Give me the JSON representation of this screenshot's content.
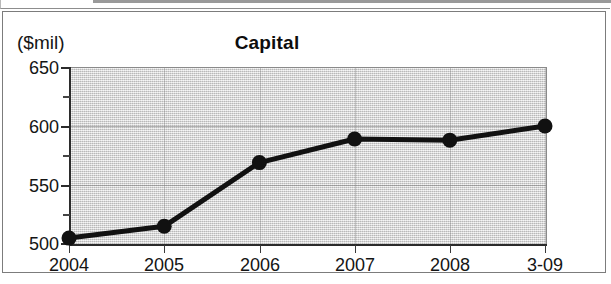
{
  "chart_data": {
    "type": "line",
    "title": "Capital",
    "xlabel": "",
    "ylabel": "($mil)",
    "categories": [
      "2004",
      "2005",
      "2006",
      "2007",
      "2008",
      "3-09"
    ],
    "values": [
      505,
      515,
      569,
      589,
      588,
      600
    ],
    "series": [
      {
        "name": "Capital",
        "values": [
          505,
          515,
          569,
          589,
          588,
          600
        ]
      }
    ],
    "ylim": [
      500,
      650
    ],
    "ytick_labels": [
      "500",
      "550",
      "600",
      "650"
    ],
    "ytick_values": [
      500,
      550,
      600,
      650
    ],
    "yminor_tick_values": [
      525,
      575,
      625
    ],
    "xtick_labels": [
      "2004",
      "2005",
      "2006",
      "2007",
      "2008",
      "3-09"
    ],
    "grid": true,
    "legend": "none",
    "marker": "filled-circle",
    "line_color": "#111111",
    "marker_color": "#111111",
    "plot_background_color": "#d2d2d2",
    "figure_background_color": "#ffffff"
  },
  "axis": {
    "unit_label": "($mil)"
  }
}
